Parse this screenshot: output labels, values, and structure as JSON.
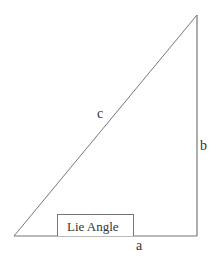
{
  "diagram": {
    "type": "right-triangle",
    "stroke_color": "#777777",
    "text_color": "#333333",
    "vertices": {
      "bottom_left": [
        14,
        236
      ],
      "bottom_right": [
        197,
        236
      ],
      "top_right": [
        197,
        15
      ]
    },
    "labels": {
      "hypotenuse": "c",
      "vertical_side": "b",
      "horizontal_side": "a"
    },
    "angle_box": {
      "text": "Lie Angle"
    }
  }
}
